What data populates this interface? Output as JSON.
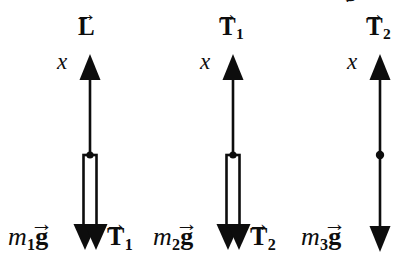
{
  "figure": {
    "title": "",
    "background_color": "#ffffff",
    "stroke_color": "#0d0d0d",
    "width": 419,
    "height": 271
  },
  "partial_glyph": {
    "text": "g",
    "note": "clipped descender at top edge"
  },
  "diagrams": [
    {
      "id": "body-1",
      "axis_label": "x",
      "top_force": {
        "symbol": "L",
        "subscript": "",
        "arrow": "→",
        "direction": "up"
      },
      "bottom_force_left": {
        "symbol": "g",
        "mass": "m",
        "mass_subscript": "1",
        "arrow": "→",
        "direction": "down"
      },
      "bottom_force_right": {
        "symbol": "T",
        "subscript": "1",
        "arrow": "→",
        "direction": "down"
      },
      "element": "rod",
      "center_x": 90
    },
    {
      "id": "body-2",
      "axis_label": "x",
      "top_force": {
        "symbol": "T",
        "subscript": "1",
        "arrow": "→",
        "direction": "up"
      },
      "bottom_force_left": {
        "symbol": "g",
        "mass": "m",
        "mass_subscript": "2",
        "arrow": "→",
        "direction": "down"
      },
      "bottom_force_right": {
        "symbol": "T",
        "subscript": "2",
        "arrow": "→",
        "direction": "down"
      },
      "element": "rod",
      "center_x": 233
    },
    {
      "id": "body-3",
      "axis_label": "x",
      "top_force": {
        "symbol": "T",
        "subscript": "2",
        "arrow": "→",
        "direction": "up"
      },
      "bottom_force_left": {
        "symbol": "g",
        "mass": "m",
        "mass_subscript": "3",
        "arrow": "→",
        "direction": "down"
      },
      "bottom_force_right": null,
      "element": "point-mass",
      "center_x": 380
    }
  ]
}
